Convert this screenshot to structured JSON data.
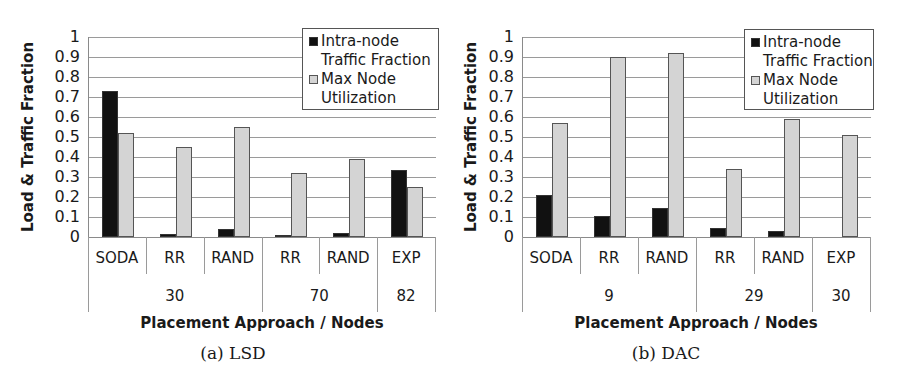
{
  "chart_data": [
    {
      "type": "bar",
      "title": "",
      "caption": "(a) LSD",
      "xlabel": "Placement Approach / Nodes",
      "ylabel": "Load & Traffic Fraction",
      "ylim": [
        0,
        1
      ],
      "yticks": [
        "0",
        "0.1",
        "0.2",
        "0.3",
        "0.4",
        "0.5",
        "0.6",
        "0.7",
        "0.8",
        "0.9",
        "1"
      ],
      "grid": true,
      "legend_position": "top-right",
      "categories": [
        "SODA",
        "RR",
        "RAND",
        "RR",
        "RAND",
        "EXP"
      ],
      "groups": [
        {
          "label": "30",
          "span": 3
        },
        {
          "label": "70",
          "span": 2
        },
        {
          "label": "82",
          "span": 1
        }
      ],
      "series": [
        {
          "name": "Intra-node Traffic Fraction",
          "color": "#111111",
          "values": [
            0.73,
            0.015,
            0.04,
            0.005,
            0.02,
            0.335
          ]
        },
        {
          "name": "Max Node Utilization",
          "color": "#d4d4d4",
          "values": [
            0.52,
            0.45,
            0.55,
            0.32,
            0.39,
            0.25
          ]
        }
      ]
    },
    {
      "type": "bar",
      "title": "",
      "caption": "(b) DAC",
      "xlabel": "Placement Approach / Nodes",
      "ylabel": "Load & Traffic Fraction",
      "ylim": [
        0,
        1
      ],
      "yticks": [
        "0",
        "0.1",
        "0.2",
        "0.3",
        "0.4",
        "0.5",
        "0.6",
        "0.7",
        "0.8",
        "0.9",
        "1"
      ],
      "grid": true,
      "legend_position": "top-right",
      "categories": [
        "SODA",
        "RR",
        "RAND",
        "RR",
        "RAND",
        "EXP"
      ],
      "groups": [
        {
          "label": "9",
          "span": 3
        },
        {
          "label": "29",
          "span": 2
        },
        {
          "label": "30",
          "span": 1
        }
      ],
      "series": [
        {
          "name": "Intra-node Traffic Fraction",
          "color": "#111111",
          "values": [
            0.21,
            0.105,
            0.145,
            0.045,
            0.03,
            0.0
          ]
        },
        {
          "name": "Max Node Utilization",
          "color": "#d4d4d4",
          "values": [
            0.57,
            0.9,
            0.92,
            0.34,
            0.59,
            0.51
          ]
        }
      ]
    }
  ],
  "legend": {
    "series1_line1": "Intra-node",
    "series1_line2": "Traffic Fraction",
    "series2_line1": "Max Node",
    "series2_line2": "Utilization"
  }
}
